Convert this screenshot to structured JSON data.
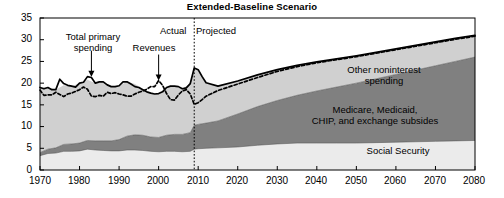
{
  "chart_data": {
    "type": "area",
    "title": "Extended-Baseline Scenario",
    "xlabel": "",
    "ylabel": "",
    "xlim": [
      1970,
      2080
    ],
    "ylim": [
      0,
      35
    ],
    "grid": false,
    "legend_position": "inline-annotations",
    "yticks": [
      "0",
      "5",
      "10",
      "15",
      "20",
      "25",
      "30",
      "35"
    ],
    "ytick_values": [
      0,
      5,
      10,
      15,
      20,
      25,
      30,
      35
    ],
    "xticks": [
      "1970",
      "1980",
      "1990",
      "2000",
      "2010",
      "2020",
      "2030",
      "2040",
      "2050",
      "2060",
      "2070",
      "2080"
    ],
    "xtick_values": [
      1970,
      1980,
      1990,
      2000,
      2010,
      2020,
      2030,
      2040,
      2050,
      2060,
      2070,
      2080
    ],
    "annotations": [
      {
        "text": "Total primary spending",
        "target_x": 1983,
        "target_y": 21.5
      },
      {
        "text": "Revenues",
        "target_x": 2000,
        "target_y": 20.6
      },
      {
        "text": "Actual",
        "x": 2006,
        "y": 33.6
      },
      {
        "text": "Projected",
        "x": 2011,
        "y": 33.6
      }
    ],
    "divider_year": 2009,
    "divider_style": "dotted-vertical",
    "stack_labels": [
      "Social Security",
      "Medicare, Medicaid, CHIP, and exchange subsides",
      "Other noninterest spending"
    ],
    "x": [
      1970,
      1972,
      1974,
      1976,
      1978,
      1980,
      1982,
      1984,
      1986,
      1988,
      1990,
      1992,
      1994,
      1996,
      1998,
      2000,
      2002,
      2004,
      2006,
      2008,
      2009,
      2010,
      2012,
      2015,
      2020,
      2025,
      2030,
      2035,
      2040,
      2045,
      2050,
      2055,
      2060,
      2065,
      2070,
      2075,
      2080
    ],
    "series": [
      {
        "name": "Social Security",
        "color": "#ebebeb",
        "values": [
          3.3,
          3.8,
          3.9,
          4.3,
          4.3,
          4.4,
          4.8,
          4.6,
          4.5,
          4.4,
          4.4,
          4.6,
          4.6,
          4.5,
          4.3,
          4.2,
          4.3,
          4.3,
          4.2,
          4.3,
          4.8,
          4.9,
          5.0,
          5.1,
          5.3,
          5.7,
          6.0,
          6.2,
          6.2,
          6.2,
          6.2,
          6.3,
          6.4,
          6.5,
          6.6,
          6.7,
          6.8
        ]
      },
      {
        "name": "Medicare, Medicaid, CHIP, and exchange subsides",
        "color": "#808080",
        "values": [
          0.7,
          1.0,
          1.2,
          1.6,
          1.7,
          1.8,
          2.0,
          2.1,
          2.2,
          2.3,
          2.6,
          3.2,
          3.5,
          3.5,
          3.3,
          3.3,
          3.7,
          3.9,
          4.0,
          4.3,
          5.5,
          5.6,
          5.8,
          6.2,
          7.6,
          8.9,
          10.0,
          11.0,
          12.0,
          12.9,
          13.8,
          14.7,
          15.6,
          16.5,
          17.4,
          18.3,
          19.2
        ]
      },
      {
        "name": "Other noninterest spending",
        "color": "#d0d0d0",
        "values": [
          15.0,
          14.2,
          13.4,
          13.6,
          13.3,
          13.8,
          14.0,
          13.3,
          13.6,
          12.5,
          12.4,
          12.5,
          11.7,
          10.7,
          10.1,
          10.1,
          11.0,
          11.1,
          10.5,
          11.3,
          13.2,
          12.6,
          9.3,
          8.0,
          7.6,
          7.3,
          7.1,
          6.9,
          6.7,
          6.5,
          6.3,
          6.1,
          5.9,
          5.7,
          5.5,
          5.3,
          5.0
        ]
      }
    ],
    "lines": [
      {
        "name": "Total primary spending",
        "style": "solid",
        "color": "#000000",
        "x": [
          1970,
          1971,
          1972,
          1973,
          1974,
          1975,
          1976,
          1977,
          1978,
          1979,
          1980,
          1981,
          1982,
          1983,
          1984,
          1985,
          1986,
          1987,
          1988,
          1989,
          1990,
          1991,
          1992,
          1993,
          1994,
          1995,
          1996,
          1997,
          1998,
          1999,
          2000,
          2001,
          2002,
          2003,
          2004,
          2005,
          2006,
          2007,
          2008,
          2009,
          2010,
          2011,
          2012,
          2015,
          2020,
          2025,
          2030,
          2035,
          2040,
          2045,
          2050,
          2055,
          2060,
          2065,
          2070,
          2075,
          2080
        ],
        "values": [
          19.0,
          18.7,
          19.0,
          18.5,
          18.5,
          20.9,
          19.9,
          19.5,
          19.3,
          19.1,
          20.0,
          20.2,
          21.5,
          21.3,
          20.0,
          20.3,
          20.3,
          19.6,
          19.2,
          19.2,
          19.4,
          20.3,
          20.3,
          19.8,
          19.2,
          19.0,
          18.5,
          18.0,
          17.7,
          17.5,
          17.6,
          18.0,
          19.0,
          19.3,
          19.3,
          19.2,
          18.7,
          18.9,
          19.9,
          23.5,
          23.1,
          21.5,
          20.1,
          19.3,
          20.5,
          21.9,
          23.1,
          24.1,
          24.9,
          25.6,
          26.3,
          27.1,
          27.9,
          28.7,
          29.5,
          30.3,
          31.0
        ]
      },
      {
        "name": "Revenues",
        "style": "dashed",
        "color": "#000000",
        "x": [
          1970,
          1971,
          1972,
          1973,
          1974,
          1975,
          1976,
          1977,
          1978,
          1979,
          1980,
          1981,
          1982,
          1983,
          1984,
          1985,
          1986,
          1987,
          1988,
          1989,
          1990,
          1991,
          1992,
          1993,
          1994,
          1995,
          1996,
          1997,
          1998,
          1999,
          2000,
          2001,
          2002,
          2003,
          2004,
          2005,
          2006,
          2007,
          2008,
          2009,
          2010,
          2011,
          2012,
          2015,
          2020,
          2025,
          2030,
          2035,
          2040,
          2045,
          2050,
          2055,
          2060,
          2065,
          2070,
          2075,
          2080
        ],
        "values": [
          18.4,
          17.2,
          17.3,
          17.3,
          17.9,
          17.4,
          16.9,
          17.5,
          17.7,
          18.1,
          18.5,
          19.1,
          18.6,
          17.0,
          16.9,
          17.2,
          17.0,
          17.9,
          17.6,
          17.8,
          17.5,
          17.3,
          17.0,
          17.0,
          17.5,
          17.9,
          18.2,
          18.6,
          19.2,
          19.2,
          20.6,
          19.5,
          17.6,
          16.2,
          16.1,
          17.3,
          18.2,
          18.5,
          17.5,
          15.1,
          15.5,
          16.2,
          17.0,
          18.3,
          19.8,
          21.3,
          22.7,
          23.8,
          24.7,
          25.4,
          26.1,
          26.9,
          27.7,
          28.5,
          29.3,
          30.1,
          30.8
        ]
      }
    ]
  },
  "axis": {
    "ytick_0": "0",
    "ytick_1": "5",
    "ytick_2": "10",
    "ytick_3": "15",
    "ytick_4": "20",
    "ytick_5": "25",
    "ytick_6": "30",
    "ytick_7": "35",
    "xtick_0": "1970",
    "xtick_1": "1980",
    "xtick_2": "1990",
    "xtick_3": "2000",
    "xtick_4": "2010",
    "xtick_5": "2020",
    "xtick_6": "2030",
    "xtick_7": "2040",
    "xtick_8": "2050",
    "xtick_9": "2060",
    "xtick_10": "2070",
    "xtick_11": "2080"
  },
  "labels": {
    "title": "Extended-Baseline Scenario",
    "total_primary_spending_line1": "Total primary",
    "total_primary_spending_line2": "spending",
    "revenues": "Revenues",
    "actual": "Actual",
    "projected": "Projected",
    "other_noninterest_line1": "Other noninterest",
    "other_noninterest_line2": "spending",
    "medicare_line1": "Medicare, Medicaid,",
    "medicare_line2": "CHIP, and exchange subsides",
    "social_security": "Social Security"
  }
}
